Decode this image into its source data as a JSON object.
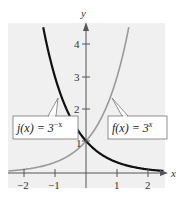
{
  "chart_data": {
    "type": "line",
    "title": "",
    "xlabel": "x",
    "ylabel": "y",
    "xlim": [
      -2.5,
      2.5
    ],
    "ylim": [
      -0.5,
      4.6
    ],
    "x_ticks": [
      "−2",
      "−1",
      "1",
      "2"
    ],
    "y_ticks": [
      "1",
      "2",
      "3",
      "4"
    ],
    "grid": false,
    "background": "#f0f0f0",
    "series": [
      {
        "name": "f(x) = 3^x",
        "label_text": "f(x) = 3",
        "label_exponent": "x",
        "formula": "3^x",
        "color": "#9a9a9a",
        "x": [
          -2.5,
          -2,
          -1.5,
          -1,
          -0.5,
          0,
          0.5,
          1,
          1.25,
          1.38
        ],
        "values": [
          0.064,
          0.111,
          0.192,
          0.333,
          0.577,
          1,
          1.732,
          3,
          3.948,
          4.55
        ]
      },
      {
        "name": "j(x) = 3^-x",
        "label_text": "j(x) = 3",
        "label_exponent": "−x",
        "formula": "3^(-x)",
        "color": "#111111",
        "x": [
          -1.38,
          -1.25,
          -1,
          -0.5,
          0,
          0.5,
          1,
          1.5,
          2,
          2.5
        ],
        "values": [
          4.55,
          3.948,
          3,
          1.732,
          1,
          0.577,
          0.333,
          0.192,
          0.111,
          0.064
        ]
      }
    ],
    "annotations": [
      {
        "text": "j(x) = 3^−x",
        "points_to_x": -0.8
      },
      {
        "text": "f(x) = 3^x",
        "points_to_x": 0.8
      },
      {
        "text": "1",
        "note": "intersection label at (0, 1)"
      }
    ]
  }
}
